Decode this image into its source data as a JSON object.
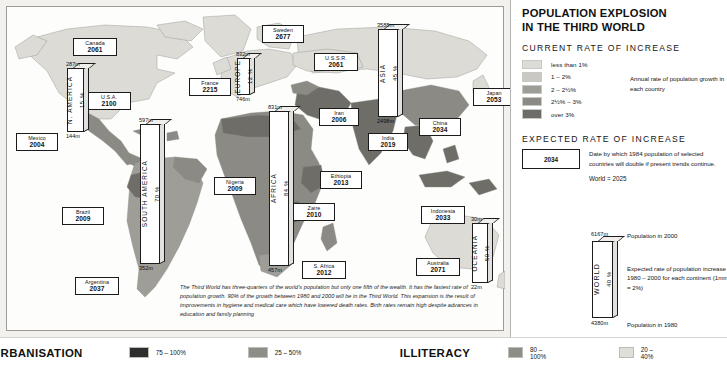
{
  "legend": {
    "title_line1": "POPULATION EXPLOSION",
    "title_line2": "IN THE THIRD WORLD",
    "current_head": "CURRENT RATE OF INCREASE",
    "classes": [
      {
        "label": "less than 1%",
        "color": "#dcdbd6"
      },
      {
        "label": "1 – 2%",
        "color": "#c9c8c2"
      },
      {
        "label": "2 – 2½%",
        "color": "#9e9d97"
      },
      {
        "label": "2½% – 3%",
        "color": "#8b8a85"
      },
      {
        "label": "over 3%",
        "color": "#6e6d68"
      }
    ],
    "classes_note": "Annual rate of population growth in each country",
    "expected_head": "EXPECTED RATE OF INCREASE",
    "expected_sample_year": "2034",
    "expected_note": "Date by which 1984 population of selected countries will double if present trends continue.",
    "world_equals": "World = 2025",
    "worldbar": {
      "name": "WORLD",
      "pct": "40 %",
      "top_value": "6167m",
      "bottom_value": "4380m",
      "top_note": "Population in 2000",
      "bottom_note": "Population in 1980",
      "side_note": "Expected rate of population increase 1980 – 2000 for each continent (1mm = 2%)"
    }
  },
  "map": {
    "blurb": "The Third World has three-quarters of the world's population but only one fifth of the wealth. It has the fastest rate of population growth. 90% of the growth between 1980 and 2000 will be in the Third World. This expansion is the result of improvements in hygiene and medical care which have lowered death rates. Birth rates remain high despite advances in education and family planning",
    "countries": [
      {
        "name": "Canada",
        "year": "2061",
        "x": 66,
        "y": 31,
        "w": 44,
        "h": 18
      },
      {
        "name": "U.S.A.",
        "year": "2100",
        "x": 80,
        "y": 85,
        "w": 44,
        "h": 18
      },
      {
        "name": "Mexico",
        "year": "2004",
        "x": 9,
        "y": 126,
        "w": 42,
        "h": 18
      },
      {
        "name": "Brazil",
        "year": "2009",
        "x": 55,
        "y": 200,
        "w": 42,
        "h": 18
      },
      {
        "name": "Argentina",
        "year": "2037",
        "x": 68,
        "y": 270,
        "w": 44,
        "h": 18
      },
      {
        "name": "France",
        "year": "2215",
        "x": 182,
        "y": 71,
        "w": 42,
        "h": 18
      },
      {
        "name": "Sweden",
        "year": "2677",
        "x": 255,
        "y": 18,
        "w": 42,
        "h": 18
      },
      {
        "name": "U.S.S.R.",
        "year": "2061",
        "x": 307,
        "y": 46,
        "w": 44,
        "h": 18
      },
      {
        "name": "Iran",
        "year": "2006",
        "x": 312,
        "y": 101,
        "w": 40,
        "h": 18
      },
      {
        "name": "Nigeria",
        "year": "2009",
        "x": 207,
        "y": 170,
        "w": 42,
        "h": 18
      },
      {
        "name": "Zaire",
        "year": "2010",
        "x": 286,
        "y": 196,
        "w": 42,
        "h": 18
      },
      {
        "name": "Ethiopia",
        "year": "2013",
        "x": 313,
        "y": 164,
        "w": 42,
        "h": 18
      },
      {
        "name": "S. Africa",
        "year": "2012",
        "x": 295,
        "y": 254,
        "w": 44,
        "h": 18
      },
      {
        "name": "India",
        "year": "2019",
        "x": 361,
        "y": 126,
        "w": 40,
        "h": 18
      },
      {
        "name": "China",
        "year": "2034",
        "x": 412,
        "y": 111,
        "w": 42,
        "h": 18
      },
      {
        "name": "Japan",
        "year": "2053",
        "x": 466,
        "y": 81,
        "w": 42,
        "h": 18
      },
      {
        "name": "Indonesia",
        "year": "2033",
        "x": 414,
        "y": 199,
        "w": 44,
        "h": 18
      },
      {
        "name": "Australia",
        "year": "2071",
        "x": 409,
        "y": 251,
        "w": 44,
        "h": 18
      }
    ],
    "bars": [
      {
        "region": "N. AMERICA",
        "pct": "15 %",
        "top": "287m",
        "bottom": "144m",
        "x": 60,
        "y": 61,
        "w": 17,
        "h": 64
      },
      {
        "region": "SOUTH AMERICA",
        "pct": "70 %",
        "top": "597m",
        "bottom": "352m",
        "x": 133,
        "y": 117,
        "w": 20,
        "h": 140
      },
      {
        "region": "EUROPE",
        "pct": "12 %",
        "top": "832m",
        "bottom": "746m",
        "x": 230,
        "y": 51,
        "w": 13,
        "h": 37
      },
      {
        "region": "AFRICA",
        "pct": "84 %",
        "top": "831m",
        "bottom": "457m",
        "x": 262,
        "y": 104,
        "w": 20,
        "h": 155
      },
      {
        "region": "ASIA",
        "pct": "45 %",
        "top": "3588m",
        "bottom": "2498m",
        "x": 371,
        "y": 22,
        "w": 20,
        "h": 88
      },
      {
        "region": "OCEANIA",
        "pct": "50 %",
        "top": "30m",
        "bottom": "22m",
        "x": 465,
        "y": 216,
        "w": 16,
        "h": 60
      }
    ]
  },
  "bottom": {
    "urbanisation": {
      "title": "URBANISATION",
      "keys": [
        {
          "label": "75 – 100%",
          "color": "#2e2e2e"
        },
        {
          "label": "25 – 50%",
          "color": "#8e8e89"
        }
      ]
    },
    "illiteracy": {
      "title": "ILLITERACY",
      "keys": [
        {
          "label": "80 – 100%",
          "color": "#8e8e89"
        },
        {
          "label": "20 – 40%",
          "color": "#dfdfda"
        }
      ]
    }
  }
}
